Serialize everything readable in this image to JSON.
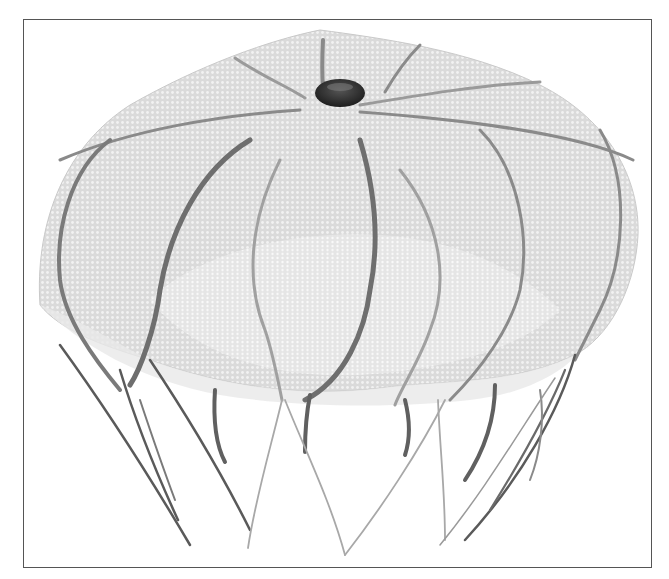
{
  "figure": {
    "style": "grayscale 3D mesh rendering",
    "frame": {
      "x": 23,
      "y": 19,
      "width": 629,
      "height": 549,
      "border_color": "#555555"
    },
    "colors": {
      "background": "#ffffff",
      "bell_fill": "#d8d8d8",
      "bell_light": "#ececec",
      "mesh_line": "#bdbdbd",
      "canal": "#6e6e6e",
      "apex_knob": "#2e2e2e",
      "tentacle_dark": "#5a5a5a",
      "tentacle_light": "#a8a8a8"
    },
    "parts": [
      "bell",
      "apex-knob",
      "radial-canals",
      "oral-arms",
      "tentacles"
    ]
  }
}
